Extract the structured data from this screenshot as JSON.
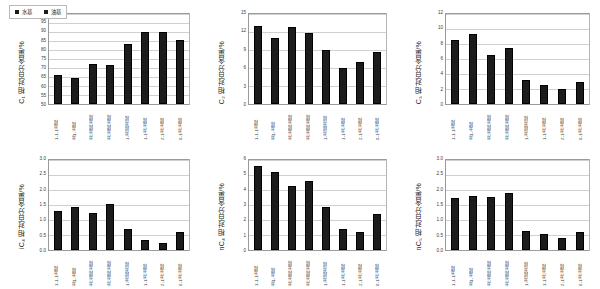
{
  "figure": {
    "background": "#ffffff",
    "bar_color": "#1c1c1c",
    "grid_color": "#d0d0d0",
    "axis_color": "#9a9a9a",
    "legend": {
      "items": [
        {
          "label": "水基",
          "marker": "square-marker"
        },
        {
          "label": "油基",
          "marker": "square-marker"
        }
      ]
    },
    "categories": [
      "1-1-1井段",
      "井1-井段",
      "井-井段-井段",
      "井-井段-井段",
      "1-井段-井段",
      "1-1井-井段",
      "2-1井-井段",
      "6-1井-井段"
    ]
  },
  "chart_data": [
    {
      "id": "c1",
      "type": "bar",
      "title": "",
      "ylabel": "C₁ 相对百分含量/%",
      "ylabel_base": "C",
      "ylabel_sub": "1",
      "ylabel_rest": " 相对百分含量/%",
      "xlabel": "",
      "categories": [
        "1-1-1井段",
        "井1-井段",
        "井-井段-井段",
        "井-井段-井段",
        "1-井段-井段",
        "1-1井-井段",
        "2-1井-井段",
        "6-1井-井段"
      ],
      "values": [
        66,
        64.5,
        72.5,
        71.5,
        83.5,
        90,
        90,
        85.5
      ],
      "ylim": [
        50,
        100
      ],
      "yticks": [
        50,
        55,
        60,
        65,
        70,
        75,
        80,
        85,
        90,
        95,
        100
      ],
      "grid": true,
      "legend_position": "top-left"
    },
    {
      "id": "c2",
      "type": "bar",
      "title": "",
      "ylabel": "C₂ 相对百分含量/%",
      "ylabel_base": "C",
      "ylabel_sub": "2",
      "ylabel_rest": " 相对百分含量/%",
      "xlabel": "",
      "categories": [
        "1-1-1井段",
        "井1-井段",
        "井-井段-井段",
        "井-井段-井段",
        "1-井段-井段",
        "1-1井-井段",
        "2-1井-井段",
        "6-1井-井段"
      ],
      "values": [
        13,
        11,
        12.9,
        11.9,
        9,
        6,
        7,
        8.6
      ],
      "ylim": [
        0,
        15
      ],
      "yticks": [
        0,
        3,
        6,
        9,
        12,
        15
      ],
      "grid": true,
      "legend_position": "none"
    },
    {
      "id": "c3",
      "type": "bar",
      "title": "",
      "ylabel": "C₃ 相对百分含量/%",
      "ylabel_base": "C",
      "ylabel_sub": "3",
      "ylabel_rest": " 相对百分含量/%",
      "xlabel": "",
      "categories": [
        "1-1-1井段",
        "井1-井段",
        "井-井段-井段",
        "井-井段-井段",
        "1-井段-井段",
        "1-1井-井段",
        "2-1井-井段",
        "6-1井-井段"
      ],
      "values": [
        8.5,
        9.3,
        6.6,
        7.5,
        3.2,
        2.5,
        2.0,
        3.0
      ],
      "ylim": [
        0,
        12
      ],
      "yticks": [
        0,
        2,
        4,
        6,
        8,
        10,
        12
      ],
      "grid": true,
      "legend_position": "none"
    },
    {
      "id": "ic4",
      "type": "bar",
      "title": "",
      "ylabel": "iC₄ 相对百分含量/%",
      "ylabel_base": "iC",
      "ylabel_sub": "4",
      "ylabel_rest": " 相对百分含量/%",
      "xlabel": "",
      "categories": [
        "1-1-1井段",
        "井1-井段",
        "井-井段-井段",
        "井-井段-井段",
        "1-井段-井段",
        "1-1井-井段",
        "2-1井-井段",
        "6-1井-井段"
      ],
      "values": [
        1.3,
        1.45,
        1.23,
        1.55,
        0.7,
        0.32,
        0.25,
        0.6
      ],
      "ylim": [
        0.0,
        3.0
      ],
      "yticks": [
        0.0,
        0.5,
        1.0,
        1.5,
        2.0,
        2.5,
        3.0
      ],
      "grid": true,
      "legend_position": "none"
    },
    {
      "id": "nc4",
      "type": "bar",
      "title": "",
      "ylabel": "nC₄ 相对百分含量/%",
      "ylabel_base": "nC",
      "ylabel_sub": "4",
      "ylabel_rest": " 相对百分含量/%",
      "xlabel": "",
      "categories": [
        "1-1-1井段",
        "井1-井段",
        "井-井段-井段",
        "井-井段-井段",
        "1-井段-井段",
        "1-1井-井段",
        "2-1井-井段",
        "6-1井-井段"
      ],
      "values": [
        5.6,
        5.2,
        4.3,
        4.6,
        2.9,
        1.4,
        1.2,
        2.4
      ],
      "ylim": [
        0.0,
        6.0
      ],
      "yticks": [
        0.0,
        1.0,
        2.0,
        3.0,
        4.0,
        5.0,
        6.0
      ],
      "grid": true,
      "legend_position": "none"
    },
    {
      "id": "nc5",
      "type": "bar",
      "title": "",
      "ylabel": "nC₅ 相对百分含量/%",
      "ylabel_base": "nC",
      "ylabel_sub": "5",
      "ylabel_rest": " 相对百分含量/%",
      "xlabel": "",
      "categories": [
        "1-1-1井段",
        "井1-井段",
        "井-井段-井段",
        "井-井段-井段",
        "1-井段-井段",
        "1-1井-井段",
        "2-1井-井段",
        "6-1井-井段"
      ],
      "values": [
        1.75,
        1.8,
        1.77,
        1.9,
        0.65,
        0.55,
        0.4,
        0.6
      ],
      "ylim": [
        0.0,
        3.0
      ],
      "yticks": [
        0.0,
        0.5,
        1.0,
        1.5,
        2.0,
        2.5,
        3.0
      ],
      "grid": true,
      "legend_position": "none"
    }
  ]
}
